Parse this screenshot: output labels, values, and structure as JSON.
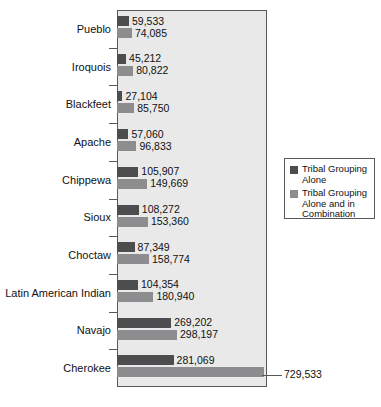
{
  "chart_data": {
    "type": "bar",
    "orientation": "horizontal",
    "title": "",
    "xlabel": "",
    "ylabel": "",
    "grid": false,
    "xlim": [
      0,
      745000
    ],
    "legend_position": "right",
    "categories": [
      "Pueblo",
      "Iroquois",
      "Blackfeet",
      "Apache",
      "Chippewa",
      "Sioux",
      "Latin American Indian",
      "Navajo",
      "Cherokee"
    ],
    "series": [
      {
        "name": "Tribal Grouping Alone",
        "color": "#4d4d4f",
        "values": [
          59533,
          45212,
          27104,
          57060,
          105907,
          108272,
          104354,
          269202,
          281069
        ],
        "labels": [
          "59,533",
          "45,212",
          "27,104",
          "57,060",
          "105,907",
          "108,272",
          "104,354",
          "269,202",
          "281,069"
        ]
      },
      {
        "name": "Tribal Grouping Alone and in Combination",
        "color": "#8d8d8f",
        "values": [
          74085,
          80822,
          85750,
          96833,
          149669,
          153360,
          180940,
          298197,
          729533
        ],
        "labels": [
          "74,085",
          "80,822",
          "85,750",
          "96,833",
          "149,669",
          "153,360",
          "180,940",
          "298,197",
          "729,533"
        ]
      }
    ]
  },
  "rows": [
    {
      "category": "Pueblo",
      "alone_label": "59,533",
      "combo_label": "74,085",
      "alone": 59533,
      "combo": 74085
    },
    {
      "category": "Iroquois",
      "alone_label": "45,212",
      "combo_label": "80,822",
      "alone": 45212,
      "combo": 80822
    },
    {
      "category": "Blackfeet",
      "alone_label": "27,104",
      "combo_label": "85,750",
      "alone": 27104,
      "combo": 85750
    },
    {
      "category": "Apache",
      "alone_label": "57,060",
      "combo_label": "96,833",
      "alone": 57060,
      "combo": 96833
    },
    {
      "category": "Chippewa",
      "alone_label": "105,907",
      "combo_label": "149,669",
      "alone": 105907,
      "combo": 149669
    },
    {
      "category": "Sioux",
      "alone_label": "108,272",
      "combo_label": "153,360",
      "alone": 108272,
      "combo": 153360
    },
    {
      "category": "Choctaw",
      "alone_label": "87,349",
      "combo_label": "158,774",
      "alone": 87349,
      "combo": 158774
    },
    {
      "category": "Latin American Indian",
      "alone_label": "104,354",
      "combo_label": "180,940",
      "alone": 104354,
      "combo": 180940
    },
    {
      "category": "Navajo",
      "alone_label": "269,202",
      "combo_label": "298,197",
      "alone": 269202,
      "combo": 298197
    },
    {
      "category": "Cherokee",
      "alone_label": "281,069",
      "combo_label": "",
      "alone": 281069,
      "combo": 729533
    }
  ],
  "callout": {
    "value_label": "729,533"
  },
  "legend": {
    "items": [
      {
        "label": "Tribal Grouping Alone",
        "color": "#4d4d4f"
      },
      {
        "label": "Tribal Grouping Alone and in Combination",
        "color": "#8d8d8f"
      }
    ]
  },
  "colors": {
    "alone": "#4d4d4f",
    "combination": "#8d8d8f",
    "plot_background": "#e9e9e9",
    "frame": "#58585a"
  }
}
